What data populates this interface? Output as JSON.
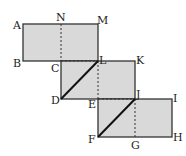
{
  "diagram": {
    "fill": "#d9d9d9",
    "stroke": "#333333",
    "labels": {
      "A": "A",
      "B": "B",
      "C": "C",
      "D": "D",
      "E": "E",
      "F": "F",
      "G": "G",
      "H": "H",
      "I": "I",
      "J": "J",
      "K": "K",
      "L": "L",
      "M": "M",
      "N": "N"
    }
  }
}
